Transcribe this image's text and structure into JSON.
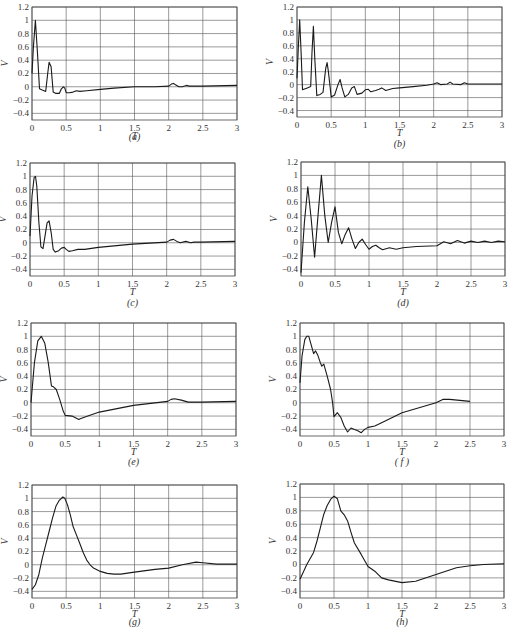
{
  "chart_data": [
    {
      "type": "line",
      "panel": "a",
      "caption": "(a)",
      "xlabel": "T",
      "ylabel": "V",
      "xlim": [
        0,
        3
      ],
      "ylim": [
        -0.5,
        1.2
      ],
      "xticks": [
        "0",
        "0.5",
        "1",
        "1.5",
        "2",
        "2.5",
        "3"
      ],
      "yticks": [
        "1.2",
        "1",
        "0.8",
        "0.6",
        "0.4",
        "0.2",
        "0",
        "-0.2",
        "-0.4"
      ],
      "grid": true,
      "x": [
        0,
        0.02,
        0.05,
        0.08,
        0.11,
        0.15,
        0.2,
        0.23,
        0.25,
        0.28,
        0.31,
        0.35,
        0.4,
        0.43,
        0.46,
        0.48,
        0.5,
        0.55,
        0.6,
        0.65,
        0.7,
        0.8,
        1.0,
        1.2,
        1.5,
        1.8,
        2.0,
        2.04,
        2.07,
        2.1,
        2.15,
        2.2,
        2.26,
        2.3,
        2.5,
        3.0
      ],
      "y": [
        0.2,
        0.6,
        1.0,
        0.5,
        -0.03,
        -0.05,
        -0.07,
        0.2,
        0.37,
        0.3,
        -0.08,
        -0.1,
        -0.1,
        -0.03,
        0.0,
        -0.02,
        -0.09,
        -0.09,
        -0.08,
        -0.06,
        -0.07,
        -0.06,
        -0.04,
        -0.02,
        0.0,
        0.0,
        0.01,
        0.04,
        0.05,
        0.03,
        0.0,
        0.0,
        0.02,
        0.01,
        0.01,
        0.02
      ]
    },
    {
      "type": "line",
      "panel": "b",
      "caption": "(b)",
      "xlabel": "T",
      "ylabel": "V",
      "xlim": [
        0,
        3
      ],
      "ylim": [
        -0.5,
        1.2
      ],
      "xticks": [
        "0",
        "0.5",
        "1",
        "1.5",
        "2",
        "2.5",
        "3"
      ],
      "yticks": [
        "1.2",
        "1",
        "0.8",
        "0.6",
        "0.4",
        "0.2",
        "0",
        "-0.2",
        "-0.4"
      ],
      "grid": true,
      "x": [
        0,
        0.02,
        0.04,
        0.06,
        0.08,
        0.1,
        0.15,
        0.2,
        0.22,
        0.24,
        0.26,
        0.29,
        0.34,
        0.38,
        0.42,
        0.44,
        0.46,
        0.5,
        0.55,
        0.6,
        0.63,
        0.66,
        0.7,
        0.75,
        0.8,
        0.84,
        0.88,
        0.95,
        1.0,
        1.04,
        1.08,
        1.15,
        1.2,
        1.24,
        1.3,
        1.4,
        1.5,
        1.7,
        1.9,
        2.0,
        2.05,
        2.1,
        2.2,
        2.24,
        2.28,
        2.4,
        2.45,
        2.5,
        2.6,
        2.8,
        3.0
      ],
      "y": [
        0.1,
        0.6,
        1.0,
        0.5,
        -0.08,
        -0.07,
        -0.05,
        -0.03,
        0.5,
        0.9,
        0.4,
        -0.17,
        -0.15,
        -0.12,
        0.25,
        0.34,
        0.2,
        -0.19,
        -0.16,
        0.0,
        0.08,
        -0.05,
        -0.19,
        -0.15,
        -0.05,
        -0.03,
        -0.15,
        -0.13,
        -0.08,
        -0.07,
        -0.11,
        -0.09,
        -0.07,
        -0.05,
        -0.09,
        -0.06,
        -0.05,
        -0.03,
        -0.01,
        0.01,
        0.03,
        0.0,
        0.01,
        0.04,
        0.01,
        0.0,
        0.03,
        0.01,
        0.01,
        0.01,
        0.01
      ]
    },
    {
      "type": "line",
      "panel": "c",
      "caption": "(c)",
      "xlabel": "T",
      "ylabel": "V",
      "xlim": [
        0,
        3
      ],
      "ylim": [
        -0.5,
        1.2
      ],
      "xticks": [
        "0",
        "0.5",
        "1",
        "1.5",
        "2",
        "2.5",
        "3"
      ],
      "yticks": [
        "1.2",
        "1",
        "0.8",
        "0.6",
        "0.4",
        "0.2",
        "0",
        "-0.2",
        "-0.4"
      ],
      "grid": true,
      "x": [
        0,
        0.03,
        0.06,
        0.08,
        0.1,
        0.13,
        0.16,
        0.19,
        0.22,
        0.25,
        0.28,
        0.31,
        0.34,
        0.37,
        0.42,
        0.46,
        0.5,
        0.53,
        0.57,
        0.62,
        0.7,
        0.8,
        1.0,
        1.5,
        2.0,
        2.05,
        2.1,
        2.15,
        2.2,
        2.28,
        2.35,
        2.4,
        2.5,
        3.0
      ],
      "y": [
        0.1,
        0.7,
        0.98,
        1.0,
        0.85,
        0.3,
        -0.06,
        -0.09,
        0.1,
        0.3,
        0.33,
        0.15,
        -0.1,
        -0.14,
        -0.12,
        -0.08,
        -0.07,
        -0.1,
        -0.13,
        -0.12,
        -0.1,
        -0.1,
        -0.07,
        -0.02,
        0.01,
        0.04,
        0.05,
        0.02,
        0.0,
        0.02,
        0.0,
        0.01,
        0.01,
        0.02
      ]
    },
    {
      "type": "line",
      "panel": "d",
      "caption": "(d)",
      "xlabel": "T",
      "ylabel": "V",
      "xlim": [
        0,
        3
      ],
      "ylim": [
        -0.5,
        1.2
      ],
      "xticks": [
        "0",
        "0.5",
        "1",
        "1.5",
        "2",
        "2.5",
        "3"
      ],
      "yticks": [
        "1.2",
        "1",
        "0.8",
        "0.6",
        "0.4",
        "0.2",
        "0",
        "-0.2",
        "-0.4"
      ],
      "grid": true,
      "x": [
        0,
        0.05,
        0.1,
        0.15,
        0.2,
        0.25,
        0.3,
        0.35,
        0.4,
        0.45,
        0.5,
        0.55,
        0.6,
        0.65,
        0.7,
        0.75,
        0.8,
        0.85,
        0.9,
        0.95,
        1.0,
        1.05,
        1.1,
        1.15,
        1.2,
        1.3,
        1.4,
        1.5,
        1.7,
        2.0,
        2.1,
        2.2,
        2.3,
        2.4,
        2.5,
        2.6,
        2.7,
        2.8,
        2.9,
        3.0
      ],
      "y": [
        -0.45,
        0.3,
        0.83,
        0.35,
        -0.22,
        0.4,
        1.0,
        0.4,
        0.0,
        0.3,
        0.53,
        0.15,
        -0.02,
        0.12,
        0.22,
        0.05,
        -0.09,
        0.0,
        0.05,
        -0.03,
        -0.1,
        -0.06,
        -0.04,
        -0.08,
        -0.11,
        -0.08,
        -0.1,
        -0.08,
        -0.06,
        -0.05,
        0.01,
        -0.02,
        0.03,
        -0.01,
        0.02,
        0.0,
        0.02,
        0.0,
        0.02,
        0.01
      ]
    },
    {
      "type": "line",
      "panel": "e",
      "caption": "(e)",
      "xlabel": "T",
      "ylabel": "V",
      "xlim": [
        0,
        3
      ],
      "ylim": [
        -0.5,
        1.2
      ],
      "xticks": [
        "0",
        "0.5",
        "1",
        "1.5",
        "2",
        "2.5",
        "3"
      ],
      "yticks": [
        "1.2",
        "1",
        "0.8",
        "0.6",
        "0.4",
        "0.2",
        "0",
        "-0.2",
        "-0.4"
      ],
      "grid": true,
      "x": [
        0,
        0.05,
        0.1,
        0.15,
        0.2,
        0.25,
        0.3,
        0.33,
        0.37,
        0.42,
        0.47,
        0.5,
        0.6,
        0.7,
        0.72,
        0.8,
        1.0,
        1.5,
        2.0,
        2.05,
        2.1,
        2.2,
        2.3,
        2.5,
        3.0
      ],
      "y": [
        0.0,
        0.6,
        0.93,
        1.0,
        0.9,
        0.62,
        0.25,
        0.24,
        0.2,
        0.05,
        -0.12,
        -0.19,
        -0.2,
        -0.25,
        -0.24,
        -0.21,
        -0.14,
        -0.04,
        0.02,
        0.05,
        0.06,
        0.04,
        0.01,
        0.01,
        0.02
      ]
    },
    {
      "type": "line",
      "panel": "f",
      "caption": "( f )",
      "xlabel": "T",
      "ylabel": "V",
      "xlim": [
        0,
        3
      ],
      "ylim": [
        -0.5,
        1.2
      ],
      "xticks": [
        "0",
        "0.5",
        "1",
        "1.5",
        "2",
        "2.5",
        "3"
      ],
      "yticks": [
        "1.2",
        "1",
        "0.8",
        "0.6",
        "0.4",
        "0.2",
        "0",
        "-0.2",
        "-0.4"
      ],
      "grid": true,
      "x": [
        0,
        0.03,
        0.07,
        0.1,
        0.13,
        0.17,
        0.2,
        0.23,
        0.26,
        0.3,
        0.32,
        0.35,
        0.4,
        0.45,
        0.48,
        0.5,
        0.55,
        0.6,
        0.65,
        0.7,
        0.75,
        0.8,
        0.85,
        0.9,
        0.95,
        1.0,
        1.1,
        1.2,
        1.5,
        2.0,
        2.1,
        2.2,
        2.5
      ],
      "y": [
        0.3,
        0.7,
        0.95,
        1.0,
        1.0,
        0.85,
        0.74,
        0.78,
        0.72,
        0.6,
        0.55,
        0.58,
        0.4,
        0.2,
        0.0,
        -0.21,
        -0.15,
        -0.22,
        -0.35,
        -0.44,
        -0.38,
        -0.4,
        -0.42,
        -0.45,
        -0.4,
        -0.37,
        -0.35,
        -0.3,
        -0.15,
        0.0,
        0.05,
        0.05,
        0.02
      ]
    },
    {
      "type": "line",
      "panel": "g",
      "caption": "(g)",
      "xlabel": "T",
      "ylabel": "V",
      "xlim": [
        0,
        3
      ],
      "ylim": [
        -0.5,
        1.2
      ],
      "xticks": [
        "0",
        "0.5",
        "1",
        "1.5",
        "2",
        "2.5",
        "3"
      ],
      "yticks": [
        "1.2",
        "1",
        "0.8",
        "0.6",
        "0.4",
        "0.2",
        "0",
        "-0.2",
        "-0.4"
      ],
      "grid": true,
      "x": [
        0,
        0.05,
        0.1,
        0.15,
        0.2,
        0.25,
        0.3,
        0.35,
        0.4,
        0.45,
        0.48,
        0.52,
        0.56,
        0.6,
        0.65,
        0.7,
        0.75,
        0.8,
        0.85,
        0.9,
        1.0,
        1.1,
        1.2,
        1.3,
        1.5,
        1.8,
        2.0,
        2.2,
        2.4,
        2.5,
        2.7,
        3.0
      ],
      "y": [
        -0.37,
        -0.3,
        -0.15,
        0.1,
        0.3,
        0.5,
        0.7,
        0.88,
        0.97,
        1.02,
        1.0,
        0.9,
        0.75,
        0.58,
        0.45,
        0.32,
        0.18,
        0.07,
        0.0,
        -0.05,
        -0.1,
        -0.13,
        -0.14,
        -0.14,
        -0.11,
        -0.07,
        -0.05,
        0.0,
        0.04,
        0.03,
        0.01,
        0.01
      ]
    },
    {
      "type": "line",
      "panel": "h",
      "caption": "(h)",
      "xlabel": "T",
      "ylabel": "V",
      "xlim": [
        0,
        3
      ],
      "ylim": [
        -0.5,
        1.2
      ],
      "xticks": [
        "0",
        "0.5",
        "1",
        "1.5",
        "2",
        "2.5",
        "3"
      ],
      "yticks": [
        "1.2",
        "1",
        "0.8",
        "0.6",
        "0.4",
        "0.2",
        "0",
        "-0.2",
        "-0.4"
      ],
      "grid": true,
      "x": [
        0,
        0.1,
        0.2,
        0.25,
        0.3,
        0.35,
        0.4,
        0.45,
        0.5,
        0.55,
        0.6,
        0.65,
        0.7,
        0.75,
        0.8,
        0.9,
        1.0,
        1.1,
        1.2,
        1.3,
        1.5,
        1.7,
        2.0,
        2.3,
        2.5,
        2.7,
        3.0
      ],
      "y": [
        -0.22,
        0.0,
        0.18,
        0.35,
        0.55,
        0.75,
        0.88,
        0.97,
        1.02,
        0.98,
        0.8,
        0.74,
        0.65,
        0.48,
        0.32,
        0.15,
        -0.03,
        -0.1,
        -0.2,
        -0.23,
        -0.27,
        -0.25,
        -0.15,
        -0.05,
        -0.02,
        0.0,
        0.01
      ]
    }
  ]
}
